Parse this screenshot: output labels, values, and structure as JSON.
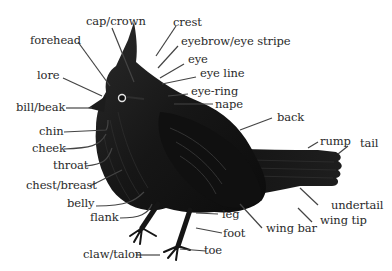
{
  "diagram": {
    "labels": {
      "cap_crown": "cap/crown",
      "crest": "crest",
      "forehead": "forehead",
      "eyebrow": "eyebrow/eye stripe",
      "eye": "eye",
      "eye_line": "eye line",
      "lore": "lore",
      "eye_ring": "eye-ring",
      "nape": "nape",
      "bill": "bill/beak",
      "back": "back",
      "chin": "chin",
      "cheek": "cheek",
      "rump": "rump",
      "tail": "tail",
      "throat": "throat",
      "chest": "chest/breast",
      "belly": "belly",
      "undertail": "undertail",
      "flank": "flank",
      "leg": "leg",
      "wing_tip": "wing tip",
      "wing_bar": "wing bar",
      "foot": "foot",
      "claw": "claw/talon",
      "toe": "toe"
    },
    "colors": {
      "bird": "#141414",
      "bird_highlight": "#3a3a3a",
      "leader_line": "#444444",
      "label_text": "#2a2a2a",
      "background": "#ffffff"
    }
  }
}
